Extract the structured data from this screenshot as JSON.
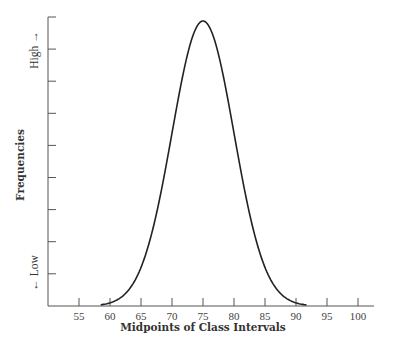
{
  "chart_data": {
    "type": "line",
    "title": "",
    "xlabel": "Midpoints of Class Intervals",
    "ylabel": "Frequencies",
    "y_high_label": "High →",
    "y_low_label": "← Low",
    "x_ticks": [
      55,
      60,
      65,
      70,
      75,
      80,
      85,
      90,
      95,
      100
    ],
    "xlim": [
      50,
      103
    ],
    "y_tick_count": 9,
    "y_tick_labels": [],
    "grid": false,
    "legend": null,
    "series": [
      {
        "name": "Normal distribution curve",
        "shape": "bell / normal",
        "mean": 75,
        "std_dev": 5,
        "x_start": 58.5,
        "x_end": 91.8,
        "x": [
          58.5,
          60,
          62.5,
          65,
          67.5,
          70,
          72.5,
          75,
          77.5,
          80,
          82.5,
          85,
          87.5,
          90,
          91.8
        ],
        "values": [
          0.4,
          1.1,
          4.4,
          13.5,
          32.5,
          60.7,
          88.2,
          100,
          88.2,
          60.7,
          32.5,
          13.5,
          4.4,
          1.1,
          0.4
        ]
      }
    ],
    "color": "#222222"
  }
}
